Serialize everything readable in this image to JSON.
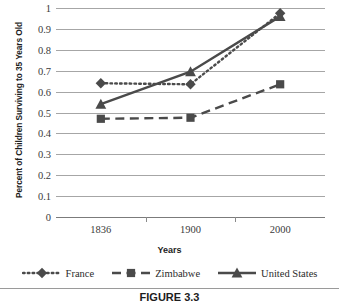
{
  "chart_data": {
    "type": "line",
    "title": "",
    "xlabel": "Years",
    "ylabel": "Percent of Children Surviving to 35 Years Old",
    "categories": [
      "1836",
      "1900",
      "2000"
    ],
    "ylim": [
      0,
      1
    ],
    "yticks": [
      "0",
      "0.1",
      "0.2",
      "0.3",
      "0.4",
      "0.5",
      "0.6",
      "0.7",
      "0.8",
      "0.9",
      "1"
    ],
    "grid": true,
    "legend_position": "bottom",
    "series": [
      {
        "name": "France",
        "values": [
          0.64,
          0.635,
          0.975
        ],
        "marker": "diamond",
        "linestyle": "dotted",
        "color": "#4a4a4a"
      },
      {
        "name": "Zimbabwe",
        "values": [
          0.47,
          0.475,
          0.635
        ],
        "marker": "square",
        "linestyle": "dashed",
        "color": "#4a4a4a"
      },
      {
        "name": "United States",
        "values": [
          0.54,
          0.695,
          0.96
        ],
        "marker": "triangle",
        "linestyle": "solid",
        "color": "#4a4a4a"
      }
    ]
  },
  "caption": {
    "label": "FIGURE 3.3"
  }
}
